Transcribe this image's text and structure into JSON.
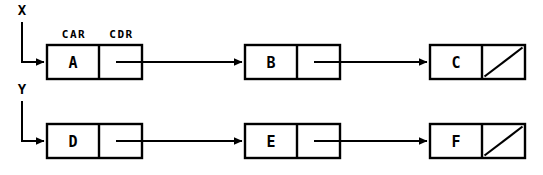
{
  "diagram": {
    "kind": "cons-cell-box-and-pointer-diagram",
    "width": 543,
    "height": 175,
    "background_color": "#ffffff",
    "ink_color": "#000000",
    "slot_labels": {
      "car": "CAR",
      "cdr": "CDR"
    },
    "lists": [
      {
        "root_label": "X",
        "cells": [
          {
            "value": "A",
            "cdr_kind": "pointer"
          },
          {
            "value": "B",
            "cdr_kind": "pointer"
          },
          {
            "value": "C",
            "cdr_kind": "nil"
          }
        ]
      },
      {
        "root_label": "Y",
        "cells": [
          {
            "value": "D",
            "cdr_kind": "pointer"
          },
          {
            "value": "E",
            "cdr_kind": "pointer"
          },
          {
            "value": "F",
            "cdr_kind": "nil"
          }
        ]
      }
    ]
  }
}
